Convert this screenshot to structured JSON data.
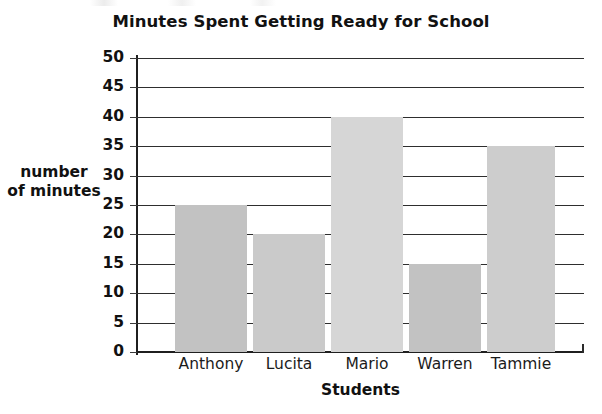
{
  "chart_data": {
    "type": "bar",
    "title": "Minutes Spent Getting Ready for School",
    "xlabel": "Students",
    "ylabel": "number of minutes",
    "ylabel_lines": [
      "number",
      "of minutes"
    ],
    "categories": [
      "Anthony",
      "Lucita",
      "Mario",
      "Warren",
      "Tammie"
    ],
    "values": [
      25,
      20,
      40,
      15,
      35
    ],
    "ylim": [
      0,
      50
    ],
    "ytick_step": 5,
    "yticks": [
      50,
      45,
      40,
      35,
      30,
      25,
      20,
      15,
      10,
      5,
      0
    ],
    "ytick_labels": [
      "50",
      "45",
      "40",
      "35",
      "30",
      "25",
      "20",
      "15",
      "10",
      "5",
      "0"
    ],
    "grid": true,
    "grid_axis": "y",
    "legend": false,
    "bar_colors": [
      "#c2c2c2",
      "#cacaca",
      "#d6d6d6",
      "#c2c2c2",
      "#cdcdcd"
    ],
    "bar_geometry": [
      {
        "label": "Anthony",
        "value": 25,
        "left": 38,
        "width": 72
      },
      {
        "label": "Lucita",
        "value": 20,
        "left": 116,
        "width": 72
      },
      {
        "label": "Mario",
        "value": 40,
        "left": 194,
        "width": 72
      },
      {
        "label": "Warren",
        "value": 15,
        "left": 272,
        "width": 72
      },
      {
        "label": "Tammie",
        "value": 35,
        "left": 350,
        "width": 68
      }
    ],
    "axis_color": "#1f1f1f",
    "grid_color": "#2e2e2e",
    "text_color": "#111111",
    "background": "#ffffff"
  }
}
